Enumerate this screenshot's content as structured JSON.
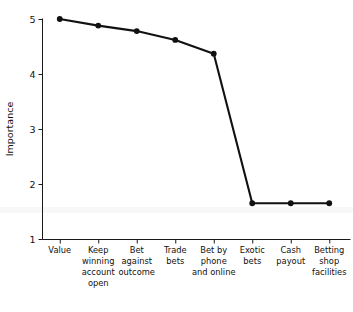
{
  "chart_data": {
    "type": "line",
    "title": "",
    "xlabel": "",
    "ylabel": "Importance",
    "ylim": [
      1,
      5
    ],
    "yticks": [
      1,
      2,
      3,
      4,
      5
    ],
    "ytick_labels": [
      "1",
      "2",
      "3",
      "4",
      "5"
    ],
    "grid": false,
    "legend": "none",
    "categories": [
      "Value",
      "Keep winning account open",
      "Bet against outcome",
      "Trade bets",
      "Bet by phone and online",
      "Exotic bets",
      "Cash payout",
      "Betting shop facilities"
    ],
    "category_lines": [
      [
        "Value"
      ],
      [
        "Keep",
        "winning",
        "account",
        "open"
      ],
      [
        "Bet",
        "against",
        "outcome"
      ],
      [
        "Trade",
        "bets"
      ],
      [
        "Bet by",
        "phone",
        "and online"
      ],
      [
        "Exotic",
        "bets"
      ],
      [
        "Cash",
        "payout"
      ],
      [
        "Betting",
        "shop",
        "facilities"
      ]
    ],
    "values": [
      5.0,
      4.88,
      4.78,
      4.62,
      4.37,
      1.65,
      1.65,
      1.65
    ],
    "marker": "circle",
    "line_color": "#111111",
    "marker_color": "#111111"
  }
}
